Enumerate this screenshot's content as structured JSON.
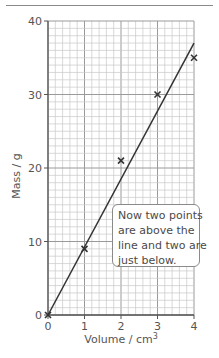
{
  "chart_data": {
    "type": "scatter",
    "title": "",
    "xlabel": "Volume / cm³",
    "ylabel": "Mass / g",
    "xlim": [
      0,
      4
    ],
    "ylim": [
      0,
      40
    ],
    "x_ticks": [
      0,
      1,
      2,
      3,
      4
    ],
    "y_ticks": [
      0,
      10,
      20,
      30,
      40
    ],
    "grid": true,
    "minor_grid": {
      "x_step": 0.2,
      "y_step": 1
    },
    "series": [
      {
        "name": "measurements",
        "marker": "x",
        "x": [
          0,
          1,
          2,
          3,
          4
        ],
        "y": [
          0,
          9,
          21,
          30,
          35
        ]
      }
    ],
    "best_fit_line": {
      "x": [
        0,
        4
      ],
      "y": [
        0,
        37
      ]
    },
    "annotations": [
      {
        "text": "Now two points are above the line and two are just below.",
        "lines": [
          "Now two points",
          "are above the",
          "line and two are",
          "just below."
        ]
      }
    ],
    "legend": null
  },
  "labels": {
    "xlabel_main": "Volume / cm",
    "xlabel_sup": "3",
    "ylabel": "Mass / g"
  },
  "callout": {
    "line1": "Now two points",
    "line2": "are above the",
    "line3": "line and two are",
    "line4": "just below."
  },
  "colors": {
    "grid_minor": "#c9c9c9",
    "grid_major": "#9a9a9a",
    "axis": "#555555",
    "line": "#333333",
    "marker": "#333333"
  }
}
